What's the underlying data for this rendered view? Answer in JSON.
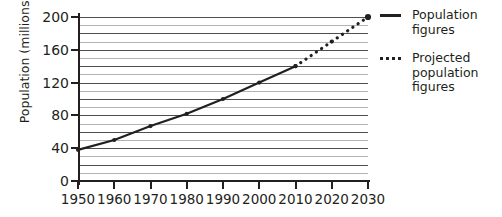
{
  "chart_data": {
    "type": "line",
    "title": "",
    "xlabel": "",
    "ylabel": "Population (millions)",
    "x": [
      1950,
      1960,
      1970,
      1980,
      1990,
      2000,
      2010,
      2020,
      2030
    ],
    "xticklabels": [
      "1950",
      "1960",
      "1970",
      "1980",
      "1990",
      "2000",
      "2010",
      "2020",
      "2030"
    ],
    "yticklabels": [
      "0",
      "40",
      "80",
      "120",
      "160",
      "200"
    ],
    "yticks": [
      0,
      40,
      80,
      120,
      160,
      200
    ],
    "ylim": [
      0,
      200
    ],
    "xlim": [
      1950,
      2030
    ],
    "grid": true,
    "grid_minor_step": 10,
    "grid_major_step": 20,
    "legend_position": "right",
    "series": [
      {
        "name": "Population figures",
        "style": "solid",
        "x": [
          1950,
          1960,
          1970,
          1980,
          1990,
          2000,
          2010
        ],
        "values": [
          38,
          50,
          67,
          82,
          100,
          120,
          140
        ]
      },
      {
        "name": "Projected population figures",
        "style": "dotted",
        "x": [
          2010,
          2020,
          2030
        ],
        "values": [
          140,
          170,
          200
        ]
      }
    ]
  },
  "legend": {
    "items": [
      {
        "label": "Population figures",
        "key": "solid-line-key",
        "color": "#231f20"
      },
      {
        "label": "Projected population figures",
        "key": "dotted-line-key",
        "color": "#231f20"
      }
    ]
  },
  "colors": {
    "ink": "#231f20",
    "grid_major": "#4f4f4f",
    "grid_minor": "#b4b4b4",
    "background": "#ffffff"
  }
}
